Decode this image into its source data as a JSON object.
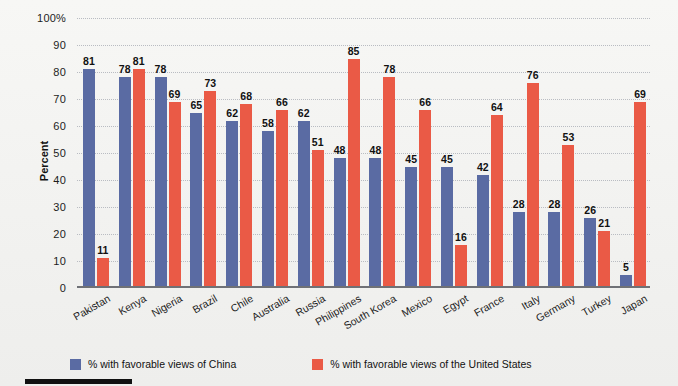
{
  "chart_data": {
    "type": "bar",
    "title": "",
    "subtitle": "",
    "xlabel": "",
    "ylabel": "Percent",
    "ylim": [
      0,
      100
    ],
    "yticks": [
      "100%",
      "90",
      "80",
      "70",
      "60",
      "50",
      "40",
      "30",
      "20",
      "10",
      "0"
    ],
    "ytick_values": [
      100,
      90,
      80,
      70,
      60,
      50,
      40,
      30,
      20,
      10,
      0
    ],
    "grid": true,
    "legend_position": "bottom-left",
    "categories": [
      "Pakistan",
      "Kenya",
      "Nigeria",
      "Brazil",
      "Chile",
      "Australia",
      "Russia",
      "Philippines",
      "South Korea",
      "Mexico",
      "Egypt",
      "France",
      "Italy",
      "Germany",
      "Turkey",
      "Japan"
    ],
    "series": [
      {
        "name": "% with favorable views of China",
        "color": "#5a6ba3",
        "values": [
          81,
          78,
          78,
          65,
          62,
          58,
          62,
          48,
          48,
          45,
          45,
          42,
          28,
          28,
          26,
          5
        ]
      },
      {
        "name": "% with favorable views of the United States",
        "color": "#ea5a46",
        "values": [
          11,
          81,
          69,
          73,
          68,
          66,
          51,
          85,
          78,
          66,
          16,
          64,
          76,
          53,
          21,
          69
        ]
      }
    ]
  },
  "colors": {
    "china": "#5a6ba3",
    "united_states": "#ea5a46",
    "gridline": "#b9bcc2",
    "axis": "#6f7176",
    "text": "#111111",
    "background": "#f4f4f2"
  }
}
